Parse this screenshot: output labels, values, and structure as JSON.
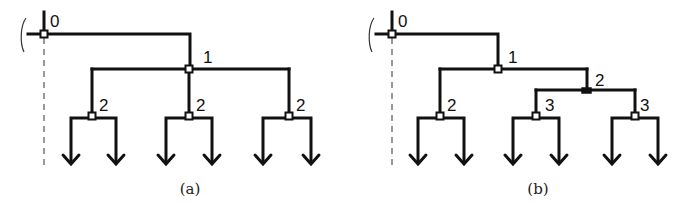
{
  "figure": {
    "panels": [
      {
        "id": "a",
        "caption": "(a)",
        "root_label": "0",
        "nodes": [
          {
            "id": "a-n0",
            "label": "0",
            "x": 44,
            "y": 34,
            "type": "open"
          },
          {
            "id": "a-n1",
            "label": "1",
            "x": 189,
            "y": 69,
            "type": "open"
          },
          {
            "id": "a-n2a",
            "label": "2",
            "x": 92,
            "y": 116,
            "type": "open"
          },
          {
            "id": "a-n2b",
            "label": "2",
            "x": 189,
            "y": 116,
            "type": "open"
          },
          {
            "id": "a-n2c",
            "label": "2",
            "x": 289,
            "y": 116,
            "type": "open"
          }
        ]
      },
      {
        "id": "b",
        "caption": "(b)",
        "root_label": "0",
        "nodes": [
          {
            "id": "b-n0",
            "label": "0",
            "x": 392,
            "y": 34,
            "type": "open"
          },
          {
            "id": "b-n1",
            "label": "1",
            "x": 498,
            "y": 69,
            "type": "open"
          },
          {
            "id": "b-n2a",
            "label": "2",
            "x": 440,
            "y": 116,
            "type": "open"
          },
          {
            "id": "b-n2b",
            "label": "2",
            "x": 587,
            "y": 90,
            "type": "filled"
          },
          {
            "id": "b-n3a",
            "label": "3",
            "x": 536,
            "y": 116,
            "type": "open"
          },
          {
            "id": "b-n3b",
            "label": "3",
            "x": 635,
            "y": 116,
            "type": "open"
          }
        ]
      }
    ]
  },
  "labels": {
    "a": {
      "n0": "0",
      "n1": "1",
      "n2a": "2",
      "n2b": "2",
      "n2c": "2",
      "caption": "(a)"
    },
    "b": {
      "n0": "0",
      "n1": "1",
      "n2a": "2",
      "n2b": "2",
      "n3a": "3",
      "n3b": "3",
      "caption": "(b)"
    }
  },
  "colors": {
    "line": "#111111",
    "background": "#ffffff",
    "dashed": "#555555"
  }
}
